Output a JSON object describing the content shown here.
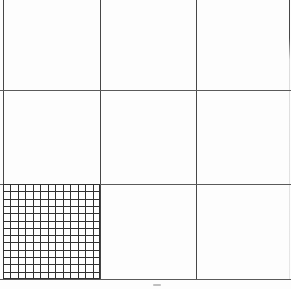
{
  "figure": {
    "canvas": {
      "width": 291,
      "height": 289,
      "background": "#fdfdfd"
    },
    "colors": {
      "major_vertical_line": "#474747",
      "major_horizontal_line": "#5a5a5a",
      "fine_grid_line": "#303030",
      "speck": "#b0b0b0"
    },
    "major_grid": {
      "rows": 3,
      "columns": 3,
      "vertical_lines": [
        {
          "name": "left-edge",
          "x": 3,
          "y1": 0,
          "y2": 280,
          "fade": false
        },
        {
          "name": "vertical-1",
          "x": 100,
          "y1": 0,
          "y2": 280,
          "fade": false
        },
        {
          "name": "vertical-2",
          "x": 196,
          "y1": 0,
          "y2": 280,
          "fade": false
        },
        {
          "name": "right-edge",
          "x": 289,
          "y1": 0,
          "y2": 280,
          "fade": true
        }
      ],
      "horizontal_lines": [
        {
          "name": "horizontal-1",
          "y": 90,
          "x1": 0,
          "x2": 291
        },
        {
          "name": "horizontal-2",
          "y": 184,
          "x1": 0,
          "x2": 291
        },
        {
          "name": "bottom-edge",
          "y": 279,
          "x1": 0,
          "x2": 291
        }
      ]
    },
    "fine_grid": {
      "x": 3,
      "y": 184,
      "width": 97,
      "height": 95,
      "columns": 13,
      "rows": 13
    },
    "speck": {
      "x": 153,
      "y": 284,
      "width": 8,
      "height": 2
    }
  }
}
